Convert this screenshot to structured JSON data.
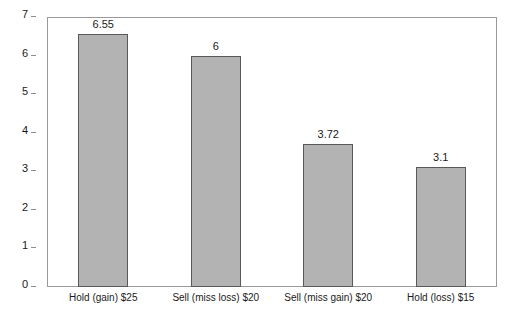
{
  "chart_data": {
    "type": "bar",
    "title": "",
    "xlabel": "",
    "ylabel": "",
    "ylim": [
      0,
      7
    ],
    "yticks": [
      0,
      1,
      2,
      3,
      4,
      5,
      6,
      7
    ],
    "grid": false,
    "legend": null,
    "categories": [
      "Hold (gain) $25",
      "Sell (miss loss) $20",
      "Sell (miss gain) $20",
      "Hold (loss) $15"
    ],
    "values": [
      6.55,
      6,
      3.72,
      3.1
    ],
    "value_labels": [
      "6.55",
      "6",
      "3.72",
      "3.1"
    ],
    "tick_labels": [
      "7",
      "6",
      "5",
      "4",
      "3",
      "2",
      "1",
      "0"
    ],
    "colors": {
      "bar_fill": "#b3b3b3",
      "bar_border": "#595959",
      "frame": "#9a9a9a",
      "text": "#1a1a1a",
      "background": "#ffffff"
    }
  }
}
